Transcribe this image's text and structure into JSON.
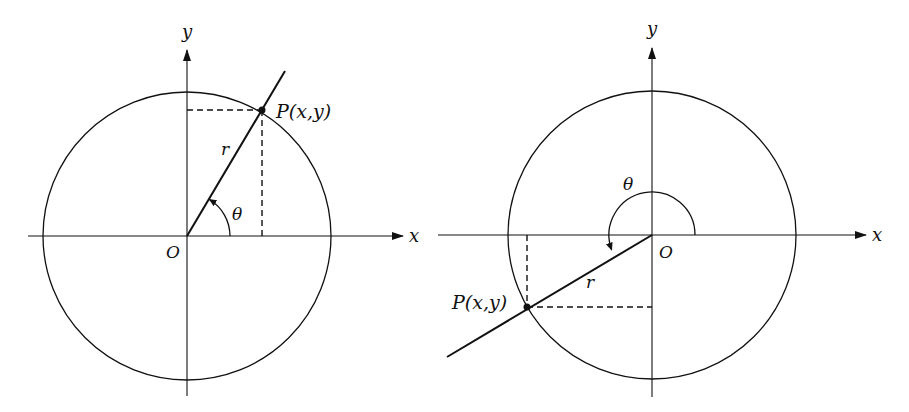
{
  "figures": [
    {
      "id": "left",
      "description": "Point P in first quadrant, angle theta acute",
      "origin": {
        "x": 187,
        "y": 236
      },
      "radius": 144,
      "point": {
        "x": 262,
        "y": 110
      },
      "ray_end": {
        "x": 285,
        "y": 71
      },
      "x_axis": {
        "x1": 28,
        "x2": 403
      },
      "y_axis": {
        "y1": 396,
        "y2": 50
      },
      "arc_radius": 43,
      "labels": {
        "x_axis": "x",
        "y_axis": "y",
        "origin": "O",
        "radius": "r",
        "angle": "θ",
        "point": "P(x,y)"
      }
    },
    {
      "id": "right",
      "description": "Point P in third quadrant, angle theta reflex (> 180°)",
      "origin": {
        "x": 652,
        "y": 235
      },
      "radius": 144,
      "point": {
        "x": 527,
        "y": 307
      },
      "ray_end": {
        "x": 447,
        "y": 357
      },
      "x_axis": {
        "x1": 438,
        "x2": 866
      },
      "y_axis": {
        "y1": 397,
        "y2": 48
      },
      "arc_radius": 43,
      "labels": {
        "x_axis": "x",
        "y_axis": "y",
        "origin": "O",
        "radius": "r",
        "angle": "θ",
        "point": "P(x,y)"
      }
    }
  ],
  "colors": {
    "ink": "#111111",
    "background": "#ffffff"
  }
}
